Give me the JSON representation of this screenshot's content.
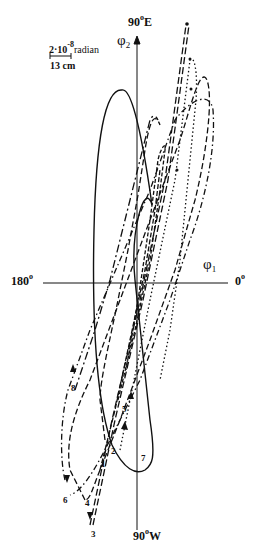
{
  "diagram": {
    "type": "polar-trajectory-plot",
    "axes": {
      "top_label": "90",
      "top_label_deg": "o",
      "top_label_dir": "E",
      "bottom_label": "90",
      "bottom_label_deg": "o",
      "bottom_label_dir": "W",
      "left_label": "180",
      "left_label_deg": "o",
      "right_label": "0",
      "right_label_deg": "o",
      "vertical_symbol": "φ",
      "vertical_sub": "2",
      "horizontal_symbol": "φ",
      "horizontal_sub": "1"
    },
    "scale_bar": {
      "value": "2·10",
      "exponent": "-8",
      "unit": "radian",
      "length_label": "13 cm"
    },
    "curve_labels": [
      "1",
      "2",
      "3",
      "4",
      "5",
      "6",
      "7",
      "8"
    ],
    "line_color": "#111111",
    "background": "#ffffff"
  }
}
